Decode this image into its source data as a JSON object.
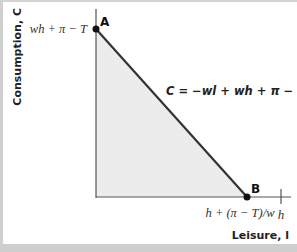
{
  "diagram": {
    "y_axis_label": "Consumption, C",
    "x_axis_label": "Leisure, l",
    "point_a": {
      "label": "A",
      "value_label": "wh + π − T"
    },
    "point_b": {
      "label": "B",
      "value_label": "h + (π − T)/w"
    },
    "x_tick_label": "h",
    "budget_line_equation": "C = −wl + wh + π  − T",
    "colors": {
      "feasible_region": "#ececec",
      "line": "#333333",
      "axis": "#555555",
      "frame": "#d0d0d0"
    }
  }
}
